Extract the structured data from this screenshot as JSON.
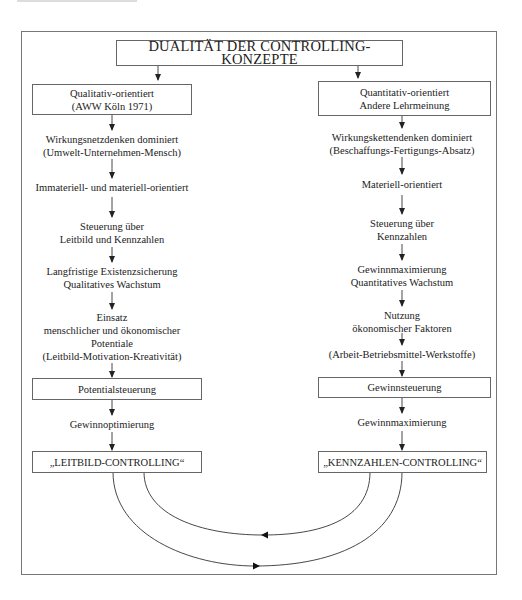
{
  "diagram": {
    "title": "DUALITÄT DER CONTROLLING-KONZEPTE",
    "left_column": {
      "header": [
        "Qualitativ-orientiert",
        "(AWW Köln 1971)"
      ],
      "steps": [
        [
          "Wirkungsnetzdenken dominiert",
          "(Umwelt-Unternehmen-Mensch)"
        ],
        [
          "Immateriell- und materiell-orientiert"
        ],
        [
          "Steuerung über",
          "Leitbild und Kennzahlen"
        ],
        [
          "Langfristige Existenzsicherung",
          "Qualitatives Wachstum"
        ],
        [
          "Einsatz",
          "menschlicher und ökonomischer",
          "Potentiale",
          "(Leitbild-Motivation-Kreativität)"
        ]
      ],
      "control_box": "Potentialsteuerung",
      "goal": "Gewinnoptimierung",
      "result_box": "„LEITBILD-CONTROLLING“"
    },
    "right_column": {
      "header": [
        "Quantitativ-orientiert",
        "Andere Lehrmeinung"
      ],
      "steps": [
        [
          "Wirkungskettendenken dominiert",
          "(Beschaffungs-Fertigungs-Absatz)"
        ],
        [
          "Materiell-orientiert"
        ],
        [
          "Steuerung über",
          "Kennzahlen"
        ],
        [
          "Gewinnmaximierung",
          "Quantitatives Wachstum"
        ],
        [
          "Nutzung",
          "ökonomischer Faktoren"
        ],
        [
          "(Arbeit-Betriebsmittel-Werkstoffe)"
        ]
      ],
      "control_box": "Gewinnsteuerung",
      "goal": "Gewinnmaximierung",
      "result_box": "„KENNZAHLEN-CONTROLLING“"
    },
    "connectors": {
      "inner_curve": "from KENNZAHLEN-CONTROLLING to LEITBILD-CONTROLLING (arrow pointing left)",
      "outer_curve": "from LEITBILD-CONTROLLING to KENNZAHLEN-CONTROLLING (arrow pointing right)"
    },
    "colors": {
      "line": "#333333",
      "border": "#666666",
      "text": "#222222"
    }
  }
}
